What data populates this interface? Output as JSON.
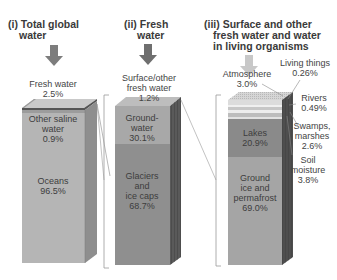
{
  "panels": [
    {
      "title_line1": "(i) Total global",
      "title_line2": "water",
      "top_label_line1": "Fresh water",
      "top_label_line2": "2.5%",
      "segments": [
        {
          "name": "Other saline water",
          "line1": "Other saline",
          "line2": "water",
          "value": "0.9%"
        },
        {
          "name": "Oceans",
          "line1": "Oceans",
          "value": "96.5%"
        }
      ]
    },
    {
      "title_line1": "(ii) Fresh",
      "title_line2": "water",
      "top_label_line1": "Surface/other",
      "top_label_line2": "fresh water",
      "top_label_line3": "1.2%",
      "segments": [
        {
          "name": "Groundwater",
          "line1": "Ground-",
          "line2": "water",
          "value": "30.1%"
        },
        {
          "name": "Glaciers and ice caps",
          "line1": "Glaciers",
          "line2": "and",
          "line3": "ice caps",
          "value": "68.7%"
        }
      ]
    },
    {
      "title_line1": "(iii) Surface and other",
      "title_line2": "fresh water and water",
      "title_line3": "in living organisms",
      "callouts": [
        {
          "name": "Atmosphere",
          "line1": "Atmosphere",
          "value": "3.0%"
        },
        {
          "name": "Living things",
          "line1": "Living things",
          "value": "0.26%"
        },
        {
          "name": "Rivers",
          "line1": "Rivers",
          "value": "0.49%"
        },
        {
          "name": "Swamps, marshes",
          "line1": "Swamps,",
          "line2": "marshes",
          "value": "2.6%"
        },
        {
          "name": "Soil moisture",
          "line1": "Soil",
          "line2": "moisture",
          "value": "3.8%"
        }
      ],
      "segments": [
        {
          "name": "Lakes",
          "line1": "Lakes",
          "value": "20.9%"
        },
        {
          "name": "Ground ice and permafrost",
          "line1": "Ground",
          "line2": "ice and",
          "line3": "permafrost",
          "value": "69.0%"
        }
      ]
    }
  ],
  "colors": {
    "arrow_dark": "#7d7d7d",
    "arrow_light": "#c8c8c8",
    "oceans": "#b3b3b3",
    "saline": "#a0a0a0",
    "groundwater": "#a6a6a6",
    "glaciers": "#8e8e8e",
    "lakes": "#8a8a8a",
    "ground_ice": "#a3a3a3"
  }
}
